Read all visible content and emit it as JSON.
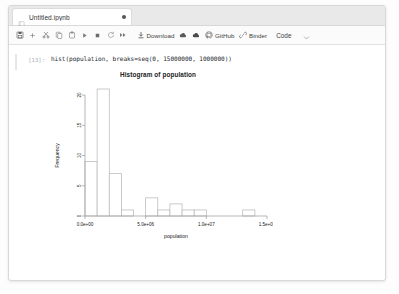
{
  "window": {
    "tab": {
      "title": "Untitled.ipynb",
      "icon": "notebook-icon",
      "modified_indicator": "●"
    }
  },
  "toolbar": {
    "buttons": [
      {
        "name": "save-button",
        "icon": "save-icon",
        "label": ""
      },
      {
        "name": "add-cell-button",
        "icon": "plus-icon",
        "label": ""
      },
      {
        "name": "cut-button",
        "icon": "scissors-icon",
        "label": ""
      },
      {
        "name": "copy-button",
        "icon": "copy-icon",
        "label": ""
      },
      {
        "name": "paste-button",
        "icon": "clipboard-icon",
        "label": ""
      },
      {
        "name": "run-button",
        "icon": "play-icon",
        "label": ""
      },
      {
        "name": "stop-button",
        "icon": "stop-icon",
        "label": ""
      },
      {
        "name": "restart-button",
        "icon": "restart-icon",
        "label": ""
      },
      {
        "name": "restart-run-all-button",
        "icon": "fast-forward-icon",
        "label": ""
      }
    ],
    "download_label": "Download",
    "download_icon": "download-icon",
    "cloud_save_icon": "cloud-upload-icon",
    "cloud_load_icon": "cloud-download-icon",
    "github_label": "GitHub",
    "github_icon": "github-icon",
    "binder_label": "Binder",
    "binder_icon": "link-icon",
    "cell_type": "Code",
    "cell_type_caret": "chevron-down-icon"
  },
  "cell": {
    "prompt": "[13]:",
    "source": "hist(population, breaks=seq(0, 15000000, 1000000))"
  },
  "chart_data": {
    "type": "bar",
    "title": "Histogram of population",
    "xlabel": "population",
    "ylabel": "Frequency",
    "bin_width": 1000000,
    "bin_edges": [
      0,
      1000000,
      2000000,
      3000000,
      4000000,
      5000000,
      6000000,
      7000000,
      8000000,
      9000000,
      10000000,
      11000000,
      12000000,
      13000000,
      14000000,
      15000000
    ],
    "categories": [
      "0-1e6",
      "1e6-2e6",
      "2e6-3e6",
      "3e6-4e6",
      "4e6-5e6",
      "5e6-6e6",
      "6e6-7e6",
      "7e6-8e6",
      "8e6-9e6",
      "9e6-1e7",
      "1e7-1.1e7",
      "1.1e7-1.2e7",
      "1.2e7-1.3e7",
      "1.3e7-1.4e7",
      "1.4e7-1.5e7"
    ],
    "values": [
      9,
      21,
      7,
      1,
      0,
      3,
      1,
      2,
      1,
      1,
      0,
      0,
      0,
      1,
      0
    ],
    "xticks": [
      0,
      5000000,
      10000000,
      15000000
    ],
    "xticklabels": [
      "0.0e+00",
      "5.0e+06",
      "1.0e+07",
      "1.5e+07"
    ],
    "yticks": [
      0,
      5,
      10,
      15,
      20
    ],
    "yticklabels": [
      "0",
      "5",
      "10",
      "15",
      "20"
    ],
    "xlim": [
      0,
      15000000
    ],
    "ylim": [
      0,
      21
    ],
    "grid": false,
    "legend": null,
    "bar_fill": "#ffffff",
    "bar_stroke": "#b4b4b4",
    "axis_color": "#9a9a9a"
  }
}
